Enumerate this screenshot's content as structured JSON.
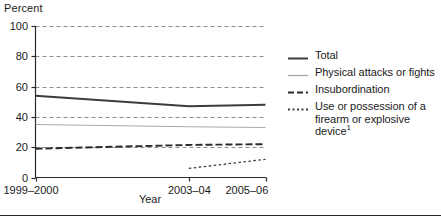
{
  "chart_data": {
    "type": "line",
    "title": "",
    "xlabel": "Year",
    "ylabel": "Percent",
    "ylim": [
      0,
      100
    ],
    "ytick_labels": [
      "0",
      "20",
      "40",
      "60",
      "80",
      "100"
    ],
    "ytick_values": [
      0,
      20,
      40,
      60,
      80,
      100
    ],
    "grid": true,
    "grid_style": "dashed-horizontal",
    "x": [
      1999,
      2003,
      2005
    ],
    "xtick_labels": [
      "1999–2000",
      "2003–04",
      "2005–06"
    ],
    "legend_position": "right",
    "series": [
      {
        "name": "Total",
        "style": "solid",
        "color": "#3c3c3c",
        "width": 1.9,
        "x": [
          1999,
          2003,
          2005
        ],
        "values": [
          54,
          47,
          48
        ]
      },
      {
        "name": "Physical attacks or fights",
        "style": "solid",
        "color": "#a8a8a8",
        "width": 1.1,
        "x": [
          1999,
          2003,
          2005
        ],
        "values": [
          35,
          33.5,
          33
        ]
      },
      {
        "name": "Insubordination",
        "style": "dashed",
        "color": "#2a2a2a",
        "width": 1.9,
        "x": [
          1999,
          2003,
          2005
        ],
        "values": [
          19,
          21.5,
          22
        ]
      },
      {
        "name": "Use or possession of a firearm or explosive device",
        "name_footnote": "1",
        "style": "dotted",
        "color": "#3c3c3c",
        "width": 1.3,
        "x": [
          2003,
          2005
        ],
        "values": [
          6,
          12
        ]
      }
    ]
  },
  "axes": {
    "y_title": "Percent",
    "x_title": "Year"
  },
  "legend": {
    "items": [
      {
        "label": "Total",
        "footnote": "",
        "swatch": "solid-dark"
      },
      {
        "label": "Physical attacks or fights",
        "footnote": "",
        "swatch": "solid-gray"
      },
      {
        "label": "Insubordination",
        "footnote": "",
        "swatch": "dashed-dark"
      },
      {
        "label": "Use or possession of a firearm or explosive device",
        "footnote": "1",
        "swatch": "dotted-dark"
      }
    ]
  }
}
